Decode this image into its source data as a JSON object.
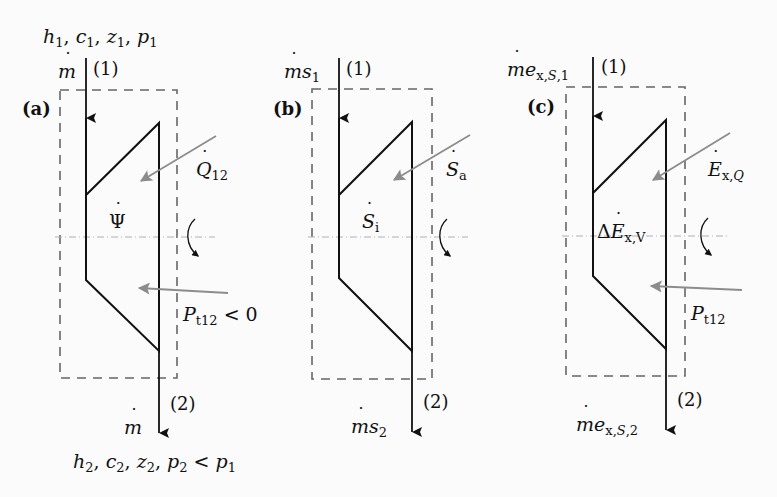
{
  "figure": {
    "panels": [
      {
        "id": "a",
        "tag": "(a)",
        "inlet_state": "h1, c1, z1, p1",
        "inlet_flow": "ṁ",
        "inlet_point": "(1)",
        "outlet_point": "(2)",
        "outlet_flow": "ṁ",
        "outlet_state": "h2, c2, z2, p2 < p1",
        "heat_label": "Q̇12",
        "inner_label": "Ψ̇",
        "power_label": "Pt12 < 0"
      },
      {
        "id": "b",
        "tag": "(b)",
        "inlet_flow": "ṁs1",
        "inlet_point": "(1)",
        "outlet_point": "(2)",
        "outlet_flow": "ṁs2",
        "heat_label": "Ṡa",
        "inner_label": "Ṡi"
      },
      {
        "id": "c",
        "tag": "(c)",
        "inlet_flow": "ṁex,S,1",
        "inlet_point": "(1)",
        "outlet_point": "(2)",
        "outlet_flow": "ṁex,S,2",
        "heat_label": "Ėx,Q",
        "inner_label": "ΔĖx,V",
        "power_label": "Pt12"
      }
    ],
    "colors": {
      "line": "#1a1a1a",
      "dashed_box": "#666666",
      "gray_arrow": "#8c8c8c",
      "axis": "#b0b0b0",
      "background": "#fbfbfb"
    }
  },
  "text": {
    "a": {
      "tag": "(a)",
      "p1": "(1)",
      "p2": "(2)",
      "h": "h",
      "c": "c",
      "z": "z",
      "p": "p",
      "s1": "1",
      "s2": "2",
      "comma": ",",
      "lt": "<",
      "m": "m",
      "Q": "Q",
      "q_sub": "12",
      "Psi": "Ψ",
      "P": "P",
      "pt_sub": "t12",
      "zero": "0"
    },
    "b": {
      "tag": "(b)",
      "p1": "(1)",
      "p2": "(2)",
      "m": "m",
      "s": "s",
      "s1": "1",
      "s2": "2",
      "S": "S",
      "a": "a",
      "i": "i"
    },
    "c": {
      "tag": "(c)",
      "p1": "(1)",
      "p2": "(2)",
      "m": "m",
      "e": "e",
      "x": "x",
      "S": "S",
      "sub1": ",1",
      "sub2": ",2",
      "E": "E",
      "Q": "Q",
      "Delta": "Δ",
      "V": "V",
      "P": "P",
      "pt_sub": "t12"
    }
  }
}
